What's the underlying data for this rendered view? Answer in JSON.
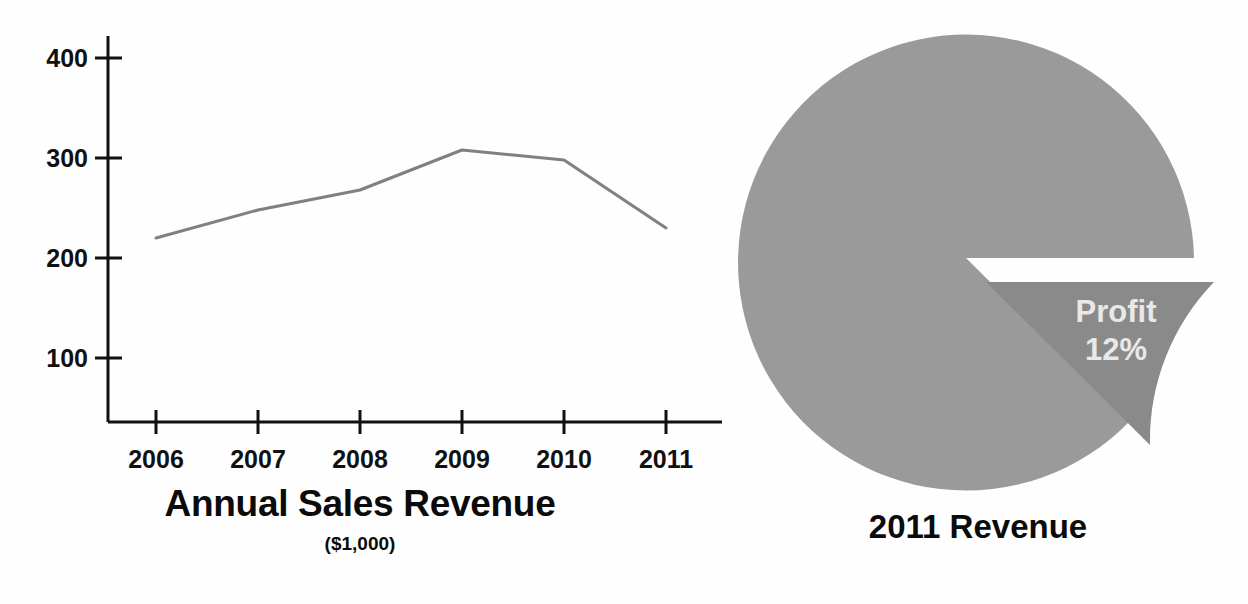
{
  "page": {
    "background_color": "#fefefe"
  },
  "line_chart": {
    "title": "Annual Sales Revenue",
    "subtitle": "($1,000)",
    "y_ticks": [
      "400",
      "300",
      "200",
      "100"
    ],
    "x_ticks": [
      "2006",
      "2007",
      "2008",
      "2009",
      "2010",
      "2011"
    ],
    "line_color": "#808080",
    "axis_color": "#111111"
  },
  "pie_chart": {
    "title": "2011 Revenue",
    "slice_label_name": "Profit",
    "slice_label_value": "12%",
    "main_color": "#9a9a9a",
    "exploded_color": "#8a8a8a",
    "label_color": "#e8e8e8"
  },
  "chart_data": [
    {
      "type": "line",
      "title": "Annual Sales Revenue",
      "subtitle": "($1,000)",
      "xlabel": "",
      "ylabel": "",
      "ylim": [
        0,
        430
      ],
      "yticks": [
        100,
        200,
        300,
        400
      ],
      "grid": false,
      "legend": "none",
      "x": [
        "2006",
        "2007",
        "2008",
        "2009",
        "2010",
        "2011"
      ],
      "categories": [
        "2006",
        "2007",
        "2008",
        "2009",
        "2010",
        "2011"
      ],
      "values": [
        220,
        248,
        268,
        308,
        298,
        230
      ],
      "series": [
        {
          "name": "Annual Sales Revenue",
          "values": [
            220,
            248,
            268,
            308,
            298,
            230
          ]
        }
      ]
    },
    {
      "type": "pie",
      "title": "2011 Revenue",
      "legend": "none",
      "labels": [
        "",
        "Profit"
      ],
      "values": [
        88,
        12
      ],
      "slices": [
        {
          "name": "",
          "value": 88,
          "label": "",
          "color": "#9a9a9a",
          "exploded": false
        },
        {
          "name": "Profit",
          "value": 12,
          "label": "Profit 12%",
          "color": "#8a8a8a",
          "exploded": true
        }
      ]
    }
  ]
}
